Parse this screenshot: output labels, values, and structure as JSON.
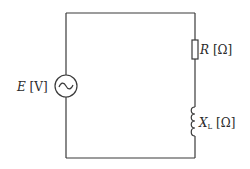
{
  "diagram": {
    "type": "series RL AC circuit",
    "source": {
      "symbol": "ac-source",
      "label_var": "E",
      "label_unit": "[V]"
    },
    "resistor": {
      "label_var": "R",
      "label_unit": "[Ω]"
    },
    "inductor": {
      "label_var": "X",
      "label_sub": "L",
      "label_unit": "[Ω]"
    }
  }
}
